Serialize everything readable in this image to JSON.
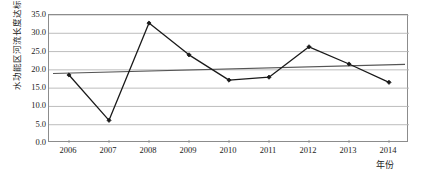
{
  "chart_data": {
    "type": "line",
    "title": "",
    "xlabel": "年份",
    "ylabel": "水功能区河流长度达标率/%",
    "x": [
      "2006",
      "2007",
      "2008",
      "2009",
      "2010",
      "2011",
      "2012",
      "2013",
      "2014"
    ],
    "categories": [
      "2006",
      "2007",
      "2008",
      "2009",
      "2010",
      "2011",
      "2012",
      "2013",
      "2014"
    ],
    "ylim": [
      0.0,
      35.0
    ],
    "ytick_labels": [
      "0.0",
      "5.0",
      "10.0",
      "15.0",
      "20.0",
      "25.0",
      "30.0",
      "35.0"
    ],
    "ytick_values": [
      0.0,
      5.0,
      10.0,
      15.0,
      20.0,
      25.0,
      30.0,
      35.0
    ],
    "grid": true,
    "legend": "none",
    "series": [
      {
        "name": "水功能区河流长度达标率",
        "kind": "line-with-markers",
        "marker": "diamond",
        "color": "#1a1a1a",
        "values": [
          18.6,
          6.2,
          32.8,
          24.1,
          17.2,
          18.0,
          26.3,
          21.6,
          16.6
        ]
      },
      {
        "name": "线性趋势线",
        "kind": "trendline",
        "marker": "none",
        "color": "#555555",
        "endpoints": [
          19.0,
          21.5
        ]
      }
    ]
  },
  "axes": {
    "y_title": "水功能区河流长度达标率/%",
    "x_title": "年份"
  },
  "colors": {
    "grid": "#b5b5b5",
    "frame": "#8c8c8c",
    "series": "#1a1a1a",
    "trend": "#555555",
    "background": "#ffffff"
  },
  "title_strip": {
    "text": ""
  }
}
